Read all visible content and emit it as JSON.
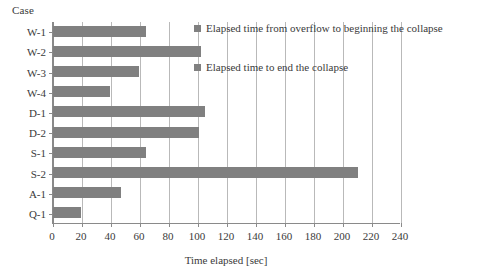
{
  "chart_data": {
    "type": "bar",
    "orientation": "horizontal",
    "title": "",
    "categories": [
      "W-1",
      "W-2",
      "W-3",
      "W-4",
      "D-1",
      "D-2",
      "S-1",
      "S-2",
      "A-1",
      "Q-1"
    ],
    "values": [
      64,
      102,
      59,
      39,
      105,
      101,
      64,
      210,
      47,
      19
    ],
    "series": [
      {
        "name": "Elapsed time to end the collapse",
        "values": [
          64,
          102,
          59,
          39,
          105,
          101,
          64,
          210,
          47,
          19
        ],
        "color": "#808080"
      }
    ],
    "xlabel": "Time elapsed [sec]",
    "ylabel": "Case",
    "xlim": [
      0,
      240
    ],
    "xticks": [
      0,
      20,
      40,
      60,
      80,
      100,
      120,
      140,
      160,
      180,
      200,
      220,
      240
    ],
    "xtick_labels": [
      "0",
      "20",
      "40",
      "60",
      "80",
      "100",
      "120",
      "140",
      "160",
      "180",
      "200",
      "220",
      "240"
    ],
    "grid": "vertical",
    "legend_position": "inside-top-right",
    "legend": [
      "Elapsed time from overflow to beginning the collapse",
      "Elapsed time to end the collapse"
    ],
    "bar_color": "#808080",
    "axis_color": "#8a8a8a",
    "gridline_color": "#b9b9b9"
  }
}
